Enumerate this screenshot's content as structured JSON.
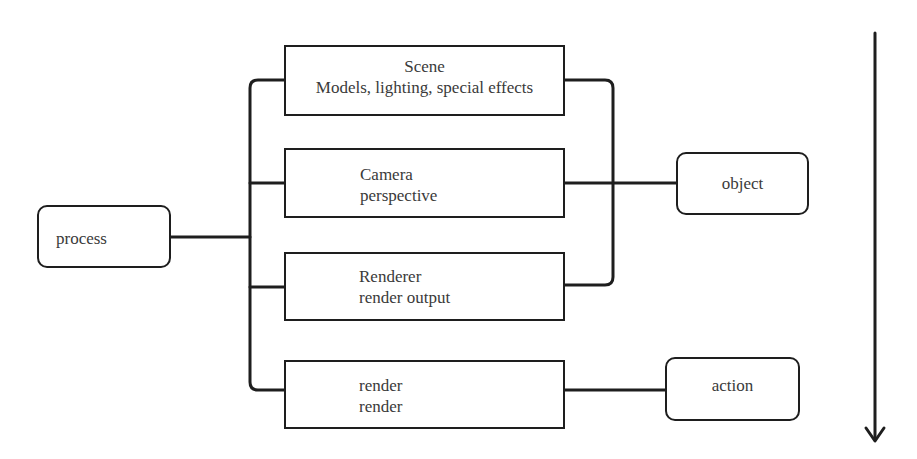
{
  "diagram": {
    "type": "flow-tree",
    "colors": {
      "stroke": "#1e1e1e",
      "text": "#3a3a3a",
      "background": "#ffffff"
    },
    "nodes": {
      "process": {
        "label": "process",
        "shape": "rounded"
      },
      "scene": {
        "title": "Scene",
        "subtitle": "Models, lighting, special effects",
        "shape": "rect"
      },
      "camera": {
        "title": "Camera",
        "subtitle": "perspective",
        "shape": "rect"
      },
      "renderer": {
        "title": "Renderer",
        "subtitle": "render output",
        "shape": "rect"
      },
      "render": {
        "title": "render",
        "subtitle": "render",
        "shape": "rect"
      },
      "object": {
        "label": "object",
        "shape": "rounded"
      },
      "action": {
        "label": "action",
        "shape": "rounded"
      }
    },
    "edges": [
      {
        "from": "process",
        "to": "scene"
      },
      {
        "from": "process",
        "to": "camera"
      },
      {
        "from": "process",
        "to": "renderer"
      },
      {
        "from": "process",
        "to": "render"
      },
      {
        "from": "scene",
        "to": "object"
      },
      {
        "from": "camera",
        "to": "object"
      },
      {
        "from": "renderer",
        "to": "object"
      },
      {
        "from": "render",
        "to": "action"
      }
    ],
    "flow_arrow": {
      "direction": "down"
    }
  }
}
